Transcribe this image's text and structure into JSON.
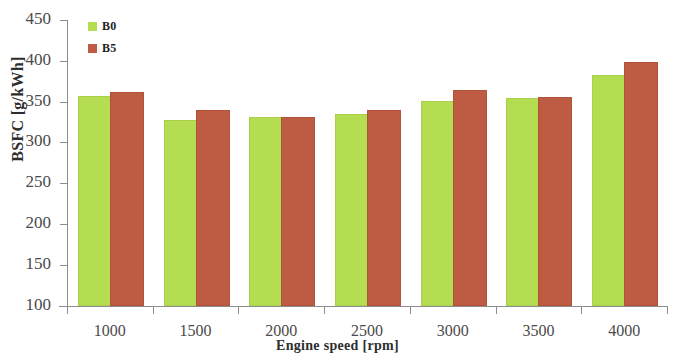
{
  "chart_data": {
    "type": "bar",
    "title": "",
    "subtitle": "",
    "xlabel": "Engine speed  [rpm]",
    "ylabel": "BSFC [g/kWh]",
    "categories": [
      "1000",
      "1500",
      "2000",
      "2500",
      "3000",
      "3500",
      "4000"
    ],
    "series": [
      {
        "name": "B0",
        "color": "#b5dd52",
        "values": [
          355,
          325,
          329,
          332,
          349,
          352,
          380
        ]
      },
      {
        "name": "B5",
        "color": "#bd5c42",
        "values": [
          359,
          337,
          329,
          338,
          362,
          353,
          396
        ]
      }
    ],
    "ylim": [
      100,
      450
    ],
    "ytick_values": [
      100,
      150,
      200,
      250,
      300,
      350,
      400,
      450
    ],
    "ytick_labels": [
      "100",
      "150",
      "200",
      "250",
      "300",
      "350",
      "400",
      "450"
    ],
    "xtick_labels": [
      "1000",
      "1500",
      "2000",
      "2500",
      "3000",
      "3500",
      "4000"
    ],
    "grid": false,
    "legend_position": "top-left",
    "legend_entries": [
      "B0",
      "B5"
    ]
  }
}
